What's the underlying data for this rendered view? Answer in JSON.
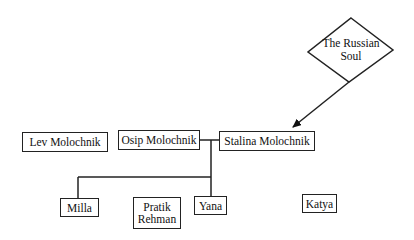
{
  "diagram": {
    "concept": {
      "label": "The Russian\nSoul"
    },
    "nodes": {
      "lev": {
        "label": "Lev Molochnik"
      },
      "osip": {
        "label": "Osip Molochnik"
      },
      "stalina": {
        "label": "Stalina Molochnik"
      },
      "milla": {
        "label": "Milla"
      },
      "pratik": {
        "label": "Pratik\nRehman"
      },
      "yana": {
        "label": "Yana"
      },
      "katya": {
        "label": "Katya"
      }
    },
    "edges": [
      {
        "from": "concept",
        "to": "stalina",
        "type": "arrow"
      },
      {
        "from": "osip",
        "to": "stalina",
        "type": "marriage-line"
      },
      {
        "from": "osip-stalina",
        "to": "milla",
        "type": "child"
      },
      {
        "from": "osip-stalina",
        "to": "yana",
        "type": "child"
      }
    ]
  }
}
